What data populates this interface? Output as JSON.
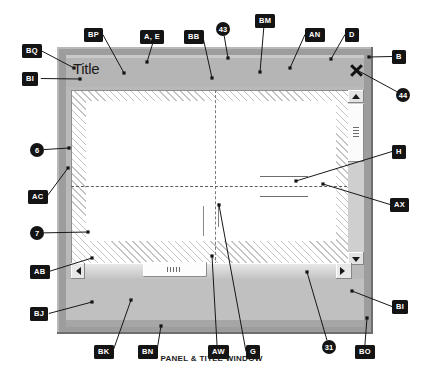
{
  "figure": {
    "caption": "PANEL & TITLE WINDOW",
    "window": {
      "title": "Title",
      "close_icon": "close-x-icon",
      "vertical_scrollbar": {
        "up_arrow": "triangle-up-icon",
        "down_arrow": "triangle-down-icon",
        "thumb_grip": "grip-lines-icon"
      },
      "horizontal_scrollbar": {
        "left_arrow": "triangle-left-icon",
        "right_arrow": "triangle-right-icon",
        "thumb_grip": "grip-lines-icon"
      }
    },
    "colors": {
      "frame": "#9d9d9d",
      "titlebar": "#b5b5b5",
      "panel": "#c0c0c0",
      "callout_bg": "#141414",
      "callout_fg": "#ffffff",
      "hatch": "#c3c3c3"
    },
    "callouts": [
      {
        "id": "BQ",
        "label": "BQ",
        "shape": "box",
        "x": 22,
        "y": 44,
        "tip_x": 74,
        "tip_y": 68
      },
      {
        "id": "BP",
        "label": "BP",
        "shape": "box",
        "x": 84,
        "y": 28,
        "tip_x": 124,
        "tip_y": 73
      },
      {
        "id": "AE",
        "label": "A, E",
        "shape": "box",
        "x": 140,
        "y": 30,
        "tip_x": 147,
        "tip_y": 62
      },
      {
        "id": "BB",
        "label": "BB",
        "shape": "box",
        "x": 184,
        "y": 30,
        "tip_x": 212,
        "tip_y": 78
      },
      {
        "id": "43",
        "label": "43",
        "shape": "circle",
        "x": 216,
        "y": 22,
        "tip_x": 228,
        "tip_y": 58
      },
      {
        "id": "BM",
        "label": "BM",
        "shape": "box",
        "x": 255,
        "y": 14,
        "tip_x": 260,
        "tip_y": 72
      },
      {
        "id": "AN",
        "label": "AN",
        "shape": "box",
        "x": 305,
        "y": 28,
        "tip_x": 290,
        "tip_y": 68
      },
      {
        "id": "D",
        "label": "D",
        "shape": "box",
        "x": 345,
        "y": 28,
        "tip_x": 331,
        "tip_y": 59
      },
      {
        "id": "B",
        "label": "B",
        "shape": "box",
        "x": 392,
        "y": 50,
        "tip_x": 369,
        "tip_y": 57
      },
      {
        "id": "44",
        "label": "44",
        "shape": "circle",
        "x": 396,
        "y": 88,
        "tip_x": 357,
        "tip_y": 70
      },
      {
        "id": "BI_top",
        "label": "BI",
        "shape": "box",
        "x": 22,
        "y": 72,
        "tip_x": 80,
        "tip_y": 79
      },
      {
        "id": "6",
        "label": "6",
        "shape": "circle",
        "x": 30,
        "y": 143,
        "tip_x": 69,
        "tip_y": 148
      },
      {
        "id": "AC",
        "label": "AC",
        "shape": "box",
        "x": 28,
        "y": 190,
        "tip_x": 68,
        "tip_y": 168
      },
      {
        "id": "7",
        "label": "7",
        "shape": "circle",
        "x": 30,
        "y": 226,
        "tip_x": 88,
        "tip_y": 232
      },
      {
        "id": "H",
        "label": "H",
        "shape": "box",
        "x": 392,
        "y": 145,
        "tip_x": 296,
        "tip_y": 181
      },
      {
        "id": "AX",
        "label": "AX",
        "shape": "box",
        "x": 390,
        "y": 198,
        "tip_x": 323,
        "tip_y": 184
      },
      {
        "id": "AB",
        "label": "AB",
        "shape": "box",
        "x": 30,
        "y": 265,
        "tip_x": 92,
        "tip_y": 258
      },
      {
        "id": "BJ",
        "label": "BJ",
        "shape": "box",
        "x": 30,
        "y": 307,
        "tip_x": 92,
        "tip_y": 302
      },
      {
        "id": "BK",
        "label": "BK",
        "shape": "box",
        "x": 94,
        "y": 345,
        "tip_x": 131,
        "tip_y": 300
      },
      {
        "id": "BN",
        "label": "BN",
        "shape": "box",
        "x": 138,
        "y": 345,
        "tip_x": 161,
        "tip_y": 326
      },
      {
        "id": "AW",
        "label": "AW",
        "shape": "box",
        "x": 208,
        "y": 345,
        "tip_x": 212,
        "tip_y": 256
      },
      {
        "id": "G",
        "label": "G",
        "shape": "box",
        "x": 246,
        "y": 345,
        "tip_x": 219,
        "tip_y": 205
      },
      {
        "id": "31",
        "label": "31",
        "shape": "circle",
        "x": 322,
        "y": 340,
        "tip_x": 307,
        "tip_y": 272
      },
      {
        "id": "BO",
        "label": "BO",
        "shape": "box",
        "x": 355,
        "y": 345,
        "tip_x": 367,
        "tip_y": 318
      },
      {
        "id": "BI_right",
        "label": "BI",
        "shape": "box",
        "x": 392,
        "y": 300,
        "tip_x": 352,
        "tip_y": 291
      }
    ]
  }
}
